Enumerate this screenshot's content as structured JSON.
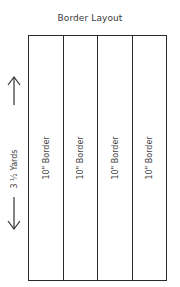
{
  "title": "Border Layout",
  "dimension": {
    "label": "3 ½ Yards",
    "arrow_up_icon": "arrow-up-icon",
    "arrow_down_icon": "arrow-down-icon"
  },
  "strips": [
    {
      "label": "10\" Border"
    },
    {
      "label": "10\" Border"
    },
    {
      "label": "10\" Border"
    },
    {
      "label": "10\" Border"
    }
  ],
  "colors": {
    "line": "#2b2b2b",
    "text": "#444444",
    "background": "#ffffff"
  }
}
